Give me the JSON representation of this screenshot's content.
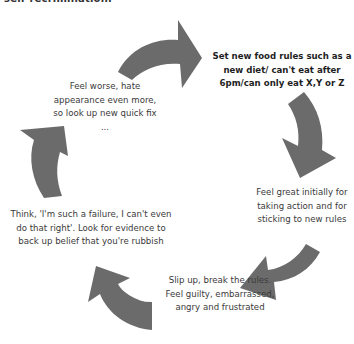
{
  "header": {
    "cut_off_text": "self-recrimination."
  },
  "diagram": {
    "type": "cycle",
    "arrow_color": "#6b6b6b",
    "steps": [
      {
        "label": "Set new food rules such as a new diet/ can't eat after 6pm/can only eat X,Y or Z",
        "emphasis": "bold"
      },
      {
        "label": "Feel great initially for taking action and for sticking to new rules",
        "emphasis": "normal"
      },
      {
        "label": "Slip up, break the rules. Feel guilty, embarrassed, angry and frustrated",
        "emphasis": "normal"
      },
      {
        "label": "Think, 'I'm such a failure, I can't even do that right'. Look for evidence to back up belief that you're rubbish",
        "emphasis": "normal"
      },
      {
        "label": "Feel worse, hate appearance even more, so look up new quick fix ...",
        "emphasis": "normal"
      }
    ]
  }
}
